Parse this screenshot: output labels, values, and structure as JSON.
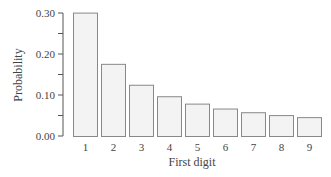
{
  "chart_data": {
    "type": "bar",
    "title": "",
    "xlabel": "First digit",
    "ylabel": "Probability",
    "categories": [
      "1",
      "2",
      "3",
      "4",
      "5",
      "6",
      "7",
      "8",
      "9"
    ],
    "values": [
      0.301,
      0.176,
      0.125,
      0.097,
      0.079,
      0.067,
      0.058,
      0.051,
      0.046
    ],
    "ylim": [
      0,
      0.3
    ],
    "yticks": [
      "0.00",
      "0.10",
      "0.20",
      "0.30"
    ],
    "ytick_values": [
      0,
      0.1,
      0.2,
      0.3
    ],
    "minor_yticks": [
      0.05,
      0.15,
      0.25
    ],
    "grid": false,
    "legend": null,
    "bar_fill": "#f3f3f3",
    "bar_stroke": "#888888"
  }
}
